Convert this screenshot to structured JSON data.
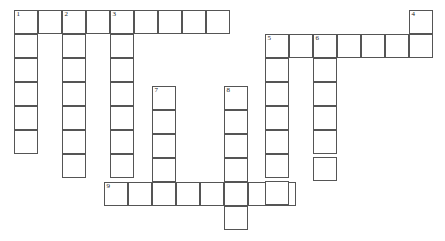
{
  "puzzle": {
    "kind": "crossword-grid",
    "title": "Crossword Puzzle Grid",
    "width": 445,
    "height": 241,
    "cell_size": 24,
    "origin_x": 14,
    "origin_y": 10,
    "border_color": "#555555",
    "cell_fill": "#ffffff",
    "background": "#ffffff",
    "number_color": "#1a1a1a",
    "entries": [
      {
        "number": "1",
        "direction": "down",
        "col": 0,
        "row": 0,
        "length": 7
      },
      {
        "number": "2",
        "direction": "down",
        "col": 2,
        "row": 0,
        "length": 8
      },
      {
        "number": "3",
        "direction": "down",
        "col": 4,
        "row": 0,
        "length": 9
      },
      {
        "number": "4",
        "direction": "down",
        "col": 16,
        "row": 0,
        "length": 2
      },
      {
        "number": "5",
        "direction": "down",
        "col": 10.5,
        "row": 1,
        "length": 8
      },
      {
        "number": "6",
        "direction": "down",
        "col": 12.5,
        "row": 1,
        "length": 7
      },
      {
        "number": "7",
        "direction": "down",
        "col": 5.75,
        "row": 4,
        "length": 5
      },
      {
        "number": "8",
        "direction": "down",
        "col": 8.75,
        "row": 4,
        "length": 7
      },
      {
        "number": "9",
        "direction": "across",
        "col": 4,
        "row": 8,
        "length": 8
      }
    ],
    "rows": [
      {
        "name": "row-1-across",
        "row": 0,
        "start_col": 0,
        "length": 9
      },
      {
        "name": "row-2-across",
        "row": 1,
        "start_col": 10.5,
        "length": 7
      },
      {
        "name": "row-9-across",
        "row": 8,
        "start_col": 4,
        "length": 8
      }
    ],
    "cells": [
      {
        "id": "r0c0",
        "x": 14,
        "y": 10,
        "num": "1"
      },
      {
        "id": "r0c1",
        "x": 38,
        "y": 10,
        "num": ""
      },
      {
        "id": "r0c2",
        "x": 62,
        "y": 10,
        "num": "2"
      },
      {
        "id": "r0c3",
        "x": 86,
        "y": 10,
        "num": ""
      },
      {
        "id": "r0c4",
        "x": 110,
        "y": 10,
        "num": "3"
      },
      {
        "id": "r0c5",
        "x": 134,
        "y": 10,
        "num": ""
      },
      {
        "id": "r0c6",
        "x": 158,
        "y": 10,
        "num": ""
      },
      {
        "id": "r0c7",
        "x": 182,
        "y": 10,
        "num": ""
      },
      {
        "id": "r0c8",
        "x": 206,
        "y": 10,
        "num": ""
      },
      {
        "id": "r0c16",
        "x": 409,
        "y": 10,
        "num": "4"
      },
      {
        "id": "r1c0",
        "x": 14,
        "y": 34,
        "num": ""
      },
      {
        "id": "r1c2",
        "x": 62,
        "y": 34,
        "num": ""
      },
      {
        "id": "r1c4",
        "x": 110,
        "y": 34,
        "num": ""
      },
      {
        "id": "r1c10",
        "x": 265,
        "y": 34,
        "num": "5"
      },
      {
        "id": "r1c11",
        "x": 289,
        "y": 34,
        "num": ""
      },
      {
        "id": "r1c12",
        "x": 313,
        "y": 34,
        "num": "6"
      },
      {
        "id": "r1c13",
        "x": 337,
        "y": 34,
        "num": ""
      },
      {
        "id": "r1c14",
        "x": 361,
        "y": 34,
        "num": ""
      },
      {
        "id": "r1c15",
        "x": 385,
        "y": 34,
        "num": ""
      },
      {
        "id": "r1c16",
        "x": 409,
        "y": 34,
        "num": ""
      },
      {
        "id": "r2c0",
        "x": 14,
        "y": 58,
        "num": ""
      },
      {
        "id": "r2c2",
        "x": 62,
        "y": 58,
        "num": ""
      },
      {
        "id": "r2c4",
        "x": 110,
        "y": 58,
        "num": ""
      },
      {
        "id": "r2c10",
        "x": 265,
        "y": 58,
        "num": ""
      },
      {
        "id": "r2c12",
        "x": 313,
        "y": 58,
        "num": ""
      },
      {
        "id": "r3c0",
        "x": 14,
        "y": 82,
        "num": ""
      },
      {
        "id": "r3c2",
        "x": 62,
        "y": 82,
        "num": ""
      },
      {
        "id": "r3c4",
        "x": 110,
        "y": 82,
        "num": ""
      },
      {
        "id": "r3c10",
        "x": 265,
        "y": 82,
        "num": ""
      },
      {
        "id": "r3c12",
        "x": 313,
        "y": 82,
        "num": ""
      },
      {
        "id": "r4c5",
        "x": 152,
        "y": 86,
        "num": "7"
      },
      {
        "id": "r4c8",
        "x": 224,
        "y": 86,
        "num": "8"
      },
      {
        "id": "r4c0",
        "x": 14,
        "y": 106,
        "num": ""
      },
      {
        "id": "r4c2",
        "x": 62,
        "y": 106,
        "num": ""
      },
      {
        "id": "r4c4",
        "x": 110,
        "y": 106,
        "num": ""
      },
      {
        "id": "r4c10",
        "x": 265,
        "y": 106,
        "num": ""
      },
      {
        "id": "r4c12",
        "x": 313,
        "y": 106,
        "num": ""
      },
      {
        "id": "r5c5",
        "x": 152,
        "y": 110,
        "num": ""
      },
      {
        "id": "r5c8",
        "x": 224,
        "y": 110,
        "num": ""
      },
      {
        "id": "r5c0",
        "x": 14,
        "y": 130,
        "num": ""
      },
      {
        "id": "r5c2",
        "x": 62,
        "y": 130,
        "num": ""
      },
      {
        "id": "r5c4",
        "x": 110,
        "y": 130,
        "num": ""
      },
      {
        "id": "r5c10",
        "x": 265,
        "y": 130,
        "num": ""
      },
      {
        "id": "r5c12",
        "x": 313,
        "y": 130,
        "num": ""
      },
      {
        "id": "r6c5",
        "x": 152,
        "y": 134,
        "num": ""
      },
      {
        "id": "r6c8",
        "x": 224,
        "y": 134,
        "num": ""
      },
      {
        "id": "r6c2",
        "x": 62,
        "y": 154,
        "num": ""
      },
      {
        "id": "r6c4",
        "x": 110,
        "y": 154,
        "num": ""
      },
      {
        "id": "r6c10",
        "x": 265,
        "y": 154,
        "num": ""
      },
      {
        "id": "r6c12",
        "x": 313,
        "y": 157,
        "num": ""
      },
      {
        "id": "r7c5",
        "x": 152,
        "y": 158,
        "num": ""
      },
      {
        "id": "r7c8",
        "x": 224,
        "y": 158,
        "num": ""
      },
      {
        "id": "r8c4",
        "x": 104,
        "y": 182,
        "num": "9"
      },
      {
        "id": "r8c5",
        "x": 128,
        "y": 182,
        "num": ""
      },
      {
        "id": "r8c6",
        "x": 152,
        "y": 182,
        "num": ""
      },
      {
        "id": "r8c7",
        "x": 176,
        "y": 182,
        "num": ""
      },
      {
        "id": "r8c8",
        "x": 200,
        "y": 182,
        "num": ""
      },
      {
        "id": "r8c9",
        "x": 224,
        "y": 182,
        "num": ""
      },
      {
        "id": "r8c10",
        "x": 248,
        "y": 182,
        "num": ""
      },
      {
        "id": "r8c11",
        "x": 272,
        "y": 182,
        "num": ""
      },
      {
        "id": "r8c12",
        "x": 265,
        "y": 181,
        "num": ""
      },
      {
        "id": "r9c8",
        "x": 224,
        "y": 206,
        "num": ""
      }
    ]
  }
}
